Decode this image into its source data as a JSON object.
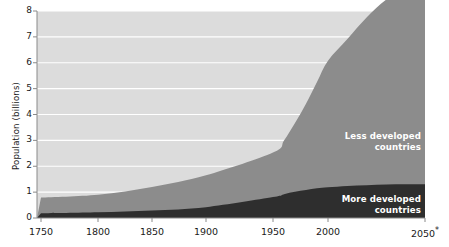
{
  "chart_data": {
    "type": "area",
    "title": "",
    "subtitle": "",
    "xlabel": "",
    "ylabel": "Population (billions)",
    "xlim": [
      1750,
      2050
    ],
    "ylim": [
      0,
      8
    ],
    "grid": true,
    "grid_color": "#ffffff",
    "legend_position": "inline-annotations",
    "stacked": true,
    "note": "2050 value is a projection, marked with an asterisk",
    "x_tick_labels": [
      "1750",
      "1800",
      "1850",
      "1900",
      "1950",
      "2000",
      "2050*"
    ],
    "x_tick_values": [
      1750,
      1800,
      1850,
      1900,
      1950,
      2000,
      2050
    ],
    "x_tick_pixels": [
      41,
      98,
      152,
      206,
      273,
      328,
      425
    ],
    "y_tick_labels": [
      "0",
      "1",
      "2",
      "3",
      "4",
      "5",
      "6",
      "7",
      "8"
    ],
    "y_tick_values": [
      0,
      1,
      2,
      3,
      4,
      5,
      6,
      7,
      8
    ],
    "x": [
      1750,
      1800,
      1850,
      1900,
      1950,
      1960,
      1970,
      1980,
      1990,
      2000,
      2010,
      2020,
      2030,
      2040,
      2050
    ],
    "series": [
      {
        "name": "More developed countries",
        "color": "#2e2e2e",
        "values": [
          0.18,
          0.22,
          0.29,
          0.42,
          0.81,
          0.92,
          1.01,
          1.08,
          1.15,
          1.19,
          1.24,
          1.27,
          1.29,
          1.3,
          1.3
        ]
      },
      {
        "name": "Less developed countries",
        "color": "#8c8c8c",
        "values": [
          0.61,
          0.68,
          0.91,
          1.23,
          1.72,
          2.08,
          2.66,
          3.34,
          4.11,
          4.89,
          5.68,
          6.49,
          7.15,
          7.6,
          7.9
        ]
      }
    ],
    "background_color": "#dcdcdc"
  },
  "axes": {
    "y_axis_title": "Population (billions)"
  },
  "annotations": [
    {
      "name": "less-developed-label",
      "line1": "Less developed",
      "line2": "countries"
    },
    {
      "name": "more-developed-label",
      "line1": "More developed",
      "line2": "countries"
    }
  ]
}
